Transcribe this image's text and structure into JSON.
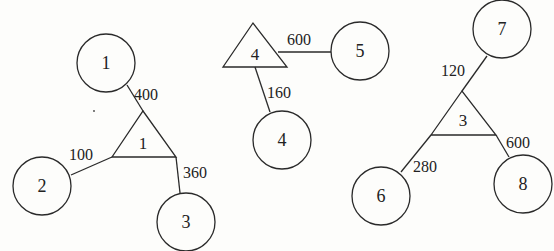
{
  "diagram": {
    "type": "network",
    "colors": {
      "stroke": "#2a2a2a",
      "text": "#222222",
      "background": "#fdfdfb"
    },
    "triangles": [
      {
        "id": "t1",
        "label": "1",
        "points": "112,157 143,111 176,157",
        "lx": 143,
        "ly": 149
      },
      {
        "id": "t4",
        "label": "4",
        "points": "223,67 253,23 287,67",
        "lx": 255,
        "ly": 60
      },
      {
        "id": "t3",
        "label": "3",
        "points": "431,135 462,91 496,135",
        "lx": 463,
        "ly": 126
      }
    ],
    "circles": [
      {
        "id": "c1",
        "label": "1",
        "cx": 106,
        "cy": 63,
        "r": 29
      },
      {
        "id": "c2",
        "label": "2",
        "cx": 42,
        "cy": 186,
        "r": 29
      },
      {
        "id": "c3",
        "label": "3",
        "cx": 186,
        "cy": 222,
        "r": 29
      },
      {
        "id": "c5",
        "label": "5",
        "cx": 360,
        "cy": 51,
        "r": 29
      },
      {
        "id": "c4",
        "label": "4",
        "cx": 282,
        "cy": 140,
        "r": 29
      },
      {
        "id": "c7",
        "label": "7",
        "cx": 502,
        "cy": 29,
        "r": 29
      },
      {
        "id": "c6",
        "label": "6",
        "cx": 381,
        "cy": 196,
        "r": 29
      },
      {
        "id": "c8",
        "label": "8",
        "cx": 523,
        "cy": 184,
        "r": 29
      }
    ],
    "edges": [
      {
        "from": "c1",
        "to": "t1",
        "weight": "400",
        "x1": 127,
        "y1": 85,
        "x2": 143,
        "y2": 111,
        "wx": 134,
        "wy": 100
      },
      {
        "from": "c2",
        "to": "t1",
        "weight": "100",
        "x1": 71,
        "y1": 175,
        "x2": 112,
        "y2": 157,
        "wx": 69,
        "wy": 160
      },
      {
        "from": "c3",
        "to": "t1",
        "weight": "360",
        "x1": 180,
        "y1": 193,
        "x2": 176,
        "y2": 157,
        "wx": 183,
        "wy": 178
      },
      {
        "from": "t4",
        "to": "c5",
        "weight": "600",
        "x1": 278,
        "y1": 52,
        "x2": 331,
        "y2": 52,
        "wx": 287,
        "wy": 45
      },
      {
        "from": "t4",
        "to": "c4",
        "weight": "160",
        "x1": 255,
        "y1": 67,
        "x2": 270,
        "y2": 112,
        "wx": 267,
        "wy": 98
      },
      {
        "from": "c7",
        "to": "t3",
        "weight": "120",
        "x1": 487,
        "y1": 56,
        "x2": 462,
        "y2": 91,
        "wx": 441,
        "wy": 76
      },
      {
        "from": "c6",
        "to": "t3",
        "weight": "280",
        "x1": 401,
        "y1": 172,
        "x2": 431,
        "y2": 135,
        "wx": 413,
        "wy": 172
      },
      {
        "from": "c8",
        "to": "t3",
        "weight": "600",
        "x1": 509,
        "y1": 157,
        "x2": 496,
        "y2": 135,
        "wx": 506,
        "wy": 148
      }
    ]
  }
}
